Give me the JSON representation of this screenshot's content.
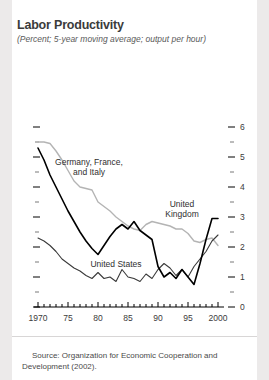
{
  "title": "Labor Productivity",
  "subtitle": "(Percent; 5-year moving average; output per hour)",
  "source": "Source: Organization for Economic Cooperation and Development (2002).",
  "source_line1": "Source: Organization for Economic Cooperation and",
  "source_line2": "Development (2002).",
  "colors": {
    "background": "#eceaea",
    "card": "#ffffff",
    "series_dark": "#000000",
    "series_gray": "#b4b4b4",
    "series_us": "#3a3a3a",
    "axis": "#000000",
    "text": "#3b3b3b"
  },
  "chart_data": {
    "type": "line",
    "title": "Labor Productivity",
    "subtitle": "(Percent; 5-year moving average; output per hour)",
    "xlabel": "",
    "ylabel": "",
    "xlim": [
      1970,
      2001
    ],
    "ylim": [
      0,
      6.3
    ],
    "yticks": [
      0,
      1,
      2,
      3,
      4,
      5,
      6
    ],
    "yticklabels": [
      "0",
      "1",
      "2",
      "3",
      "4",
      "5",
      "6"
    ],
    "yminorticks": [
      0.5,
      1.5,
      2.5,
      3.5,
      4.5,
      5.5,
      6.5
    ],
    "xticks": [
      1970,
      1975,
      1980,
      1985,
      1990,
      1995,
      2000
    ],
    "xticklabels": [
      "1970",
      "75",
      "80",
      "85",
      "90",
      "95",
      "2000"
    ],
    "xminortick_interval": 1,
    "grid": false,
    "legend_position": "inline-annotations",
    "annotations": [
      {
        "label": "Germany, France,\nand Italy",
        "line1": "Germany, France,",
        "line2": "and Italy",
        "x": 1978.5,
        "y": 4.75
      },
      {
        "label": "United\nKingdom",
        "line1": "United",
        "line2": "Kingdom",
        "x": 1994.0,
        "y": 3.35
      },
      {
        "label": "United States",
        "line1": "United States",
        "x": 1983.0,
        "y": 1.35
      }
    ],
    "x": [
      1970,
      1971,
      1972,
      1973,
      1974,
      1975,
      1976,
      1977,
      1978,
      1979,
      1980,
      1981,
      1982,
      1983,
      1984,
      1985,
      1986,
      1987,
      1988,
      1989,
      1990,
      1991,
      1992,
      1993,
      1994,
      1995,
      1996,
      1997,
      1998,
      1999,
      2000
    ],
    "series": [
      {
        "name": "Germany, France, and Italy",
        "color": "#b4b4b4",
        "values": [
          5.5,
          5.5,
          5.45,
          5.2,
          4.9,
          4.55,
          4.2,
          4.0,
          3.95,
          3.9,
          3.5,
          3.35,
          3.2,
          3.0,
          2.85,
          2.7,
          2.6,
          2.55,
          2.75,
          2.85,
          2.8,
          2.75,
          2.7,
          2.6,
          2.6,
          2.45,
          2.2,
          2.15,
          2.25,
          2.3,
          2.05
        ]
      },
      {
        "name": "United Kingdom",
        "color": "#000000",
        "values": [
          5.3,
          4.9,
          4.4,
          4.0,
          3.6,
          3.2,
          2.85,
          2.5,
          2.2,
          1.95,
          1.75,
          2.05,
          2.35,
          2.6,
          2.75,
          2.6,
          2.85,
          2.55,
          2.4,
          2.25,
          1.35,
          1.0,
          1.15,
          0.95,
          1.25,
          1.0,
          0.75,
          1.45,
          2.25,
          2.95,
          2.95
        ]
      },
      {
        "name": "United States",
        "color": "#3a3a3a",
        "values": [
          2.3,
          2.2,
          2.05,
          1.85,
          1.6,
          1.45,
          1.3,
          1.2,
          1.05,
          0.95,
          1.15,
          0.95,
          1.0,
          0.85,
          1.25,
          1.0,
          0.95,
          0.85,
          1.1,
          0.95,
          1.25,
          1.45,
          1.3,
          1.05,
          1.25,
          1.0,
          1.35,
          1.6,
          1.85,
          2.2,
          2.4
        ]
      }
    ]
  }
}
